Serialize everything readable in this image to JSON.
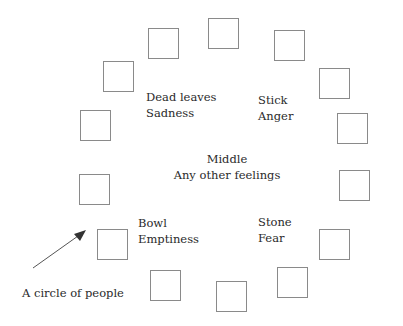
{
  "diagram": {
    "people_count": 14,
    "people": [
      {
        "x": 208,
        "y": 18
      },
      {
        "x": 148,
        "y": 28
      },
      {
        "x": 274,
        "y": 30
      },
      {
        "x": 103,
        "y": 61
      },
      {
        "x": 319,
        "y": 68
      },
      {
        "x": 80,
        "y": 110
      },
      {
        "x": 337,
        "y": 113
      },
      {
        "x": 79,
        "y": 174
      },
      {
        "x": 339,
        "y": 170
      },
      {
        "x": 97,
        "y": 229
      },
      {
        "x": 319,
        "y": 229
      },
      {
        "x": 150,
        "y": 270
      },
      {
        "x": 277,
        "y": 267
      },
      {
        "x": 216,
        "y": 281
      }
    ],
    "labels": {
      "dead_leaves": {
        "object": "Dead leaves",
        "feeling": "Sadness"
      },
      "stick": {
        "object": "Stick",
        "feeling": "Anger"
      },
      "middle": {
        "object": "Middle",
        "feeling": "Any other feelings"
      },
      "bowl": {
        "object": "Bowl",
        "feeling": "Emptiness"
      },
      "stone": {
        "object": "Stone",
        "feeling": "Fear"
      }
    },
    "annotation": "A circle of people",
    "colors": {
      "box_border": "#8a8a8a",
      "text": "#2a2a2a",
      "arrow": "#555555"
    }
  }
}
